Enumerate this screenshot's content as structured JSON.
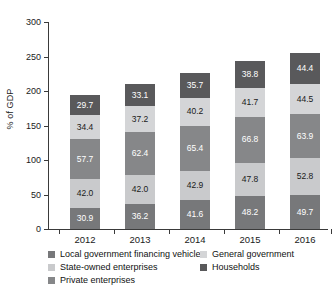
{
  "chart_data": {
    "type": "bar",
    "subtype": "stacked-vertical",
    "title": "",
    "xlabel": "",
    "ylabel": "% of GDP",
    "categories": [
      "2012",
      "2013",
      "2014",
      "2015",
      "2016"
    ],
    "ylim": [
      0,
      300
    ],
    "yticks": [
      0,
      50,
      100,
      150,
      200,
      250,
      300
    ],
    "ytick_labels": [
      "0",
      "50",
      "100",
      "150",
      "200",
      "250",
      "300"
    ],
    "grid": false,
    "legend_position": "bottom",
    "series": [
      {
        "name": "Local government financing vehicles",
        "color": "#77787a",
        "values": [
          30.9,
          41.6,
          41.6,
          48.2,
          49.7
        ],
        "labels": [
          "30.9",
          "36.2",
          "41.6",
          "48.2",
          "49.7"
        ],
        "label_color": "#ffffff",
        "stack_order": 1
      },
      {
        "name": "State-owned enterprises",
        "color": "#c9cacc",
        "values": [
          42.0,
          42.0,
          42.9,
          47.8,
          52.8
        ],
        "labels": [
          "42.0",
          "42.0",
          "42.9",
          "47.8",
          "52.8"
        ],
        "label_color": "#1a1a1a",
        "stack_order": 2
      },
      {
        "name": "Private enterprises",
        "color": "#868789",
        "values": [
          57.7,
          62.4,
          65.4,
          66.8,
          63.9
        ],
        "labels": [
          "57.7",
          "62.4",
          "65.4",
          "66.8",
          "63.9"
        ],
        "label_color": "#ffffff",
        "stack_order": 3
      },
      {
        "name": "General government",
        "color": "#d4d5d7",
        "values": [
          34.4,
          37.2,
          40.2,
          41.7,
          44.5
        ],
        "labels": [
          "34.4",
          "37.2",
          "40.2",
          "41.7",
          "44.5"
        ],
        "label_color": "#1a1a1a",
        "stack_order": 4
      },
      {
        "name": "Households",
        "color": "#59595b",
        "values": [
          29.7,
          33.1,
          35.7,
          38.8,
          44.4
        ],
        "labels": [
          "29.7",
          "33.1",
          "35.7",
          "38.8",
          "44.4"
        ],
        "label_color": "#ffffff",
        "stack_order": 5
      }
    ],
    "totals": [
      194.7,
      210.9,
      225.8,
      243.3,
      255.3
    ]
  },
  "legend": {
    "row1": {
      "left": {
        "label": "Local government financing vehicles",
        "color": "#77787a"
      },
      "right": {
        "label": "General government",
        "color": "#d4d5d7"
      }
    },
    "row2": {
      "left": {
        "label": "State-owned enterprises",
        "color": "#c9cacc"
      },
      "right": {
        "label": "Households",
        "color": "#59595b"
      }
    },
    "row3": {
      "left": {
        "label": "Private enterprises",
        "color": "#868789"
      }
    }
  }
}
